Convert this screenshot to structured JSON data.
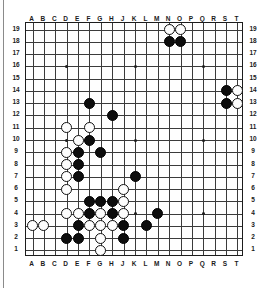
{
  "board": {
    "title": "Go board diagram",
    "size": 19,
    "column_labels": [
      "A",
      "B",
      "C",
      "D",
      "E",
      "F",
      "G",
      "H",
      "J",
      "K",
      "L",
      "M",
      "N",
      "O",
      "P",
      "Q",
      "R",
      "S",
      "T"
    ],
    "row_labels": [
      "19",
      "18",
      "17",
      "16",
      "15",
      "14",
      "13",
      "12",
      "11",
      "10",
      "9",
      "8",
      "7",
      "6",
      "5",
      "4",
      "3",
      "2",
      "1"
    ],
    "colors": {
      "black_stone": "#0d0d0d",
      "white_stone": "#fdfdfd",
      "grid_line": "#3a3a3a",
      "border": "#1c1c1c",
      "background": "#fefefe",
      "label_text": "#1a1a1a"
    },
    "star_points": [
      {
        "col": "D",
        "row": 16
      },
      {
        "col": "K",
        "row": 16
      },
      {
        "col": "Q",
        "row": 16
      },
      {
        "col": "D",
        "row": 10
      },
      {
        "col": "K",
        "row": 10
      },
      {
        "col": "Q",
        "row": 10
      },
      {
        "col": "D",
        "row": 4
      },
      {
        "col": "K",
        "row": 4
      },
      {
        "col": "Q",
        "row": 4
      }
    ],
    "black_stones": [
      {
        "col": "N",
        "row": 18
      },
      {
        "col": "O",
        "row": 18
      },
      {
        "col": "S",
        "row": 14
      },
      {
        "col": "S",
        "row": 13
      },
      {
        "col": "F",
        "row": 13
      },
      {
        "col": "H",
        "row": 12
      },
      {
        "col": "F",
        "row": 10
      },
      {
        "col": "E",
        "row": 9
      },
      {
        "col": "G",
        "row": 9
      },
      {
        "col": "E",
        "row": 8
      },
      {
        "col": "E",
        "row": 7
      },
      {
        "col": "K",
        "row": 7
      },
      {
        "col": "F",
        "row": 5
      },
      {
        "col": "G",
        "row": 5
      },
      {
        "col": "H",
        "row": 5
      },
      {
        "col": "F",
        "row": 4
      },
      {
        "col": "H",
        "row": 4
      },
      {
        "col": "M",
        "row": 4
      },
      {
        "col": "E",
        "row": 3
      },
      {
        "col": "J",
        "row": 3
      },
      {
        "col": "L",
        "row": 3
      },
      {
        "col": "D",
        "row": 2
      },
      {
        "col": "E",
        "row": 2
      },
      {
        "col": "J",
        "row": 2
      }
    ],
    "white_stones": [
      {
        "col": "N",
        "row": 19
      },
      {
        "col": "O",
        "row": 19
      },
      {
        "col": "T",
        "row": 14
      },
      {
        "col": "T",
        "row": 13
      },
      {
        "col": "D",
        "row": 11
      },
      {
        "col": "F",
        "row": 11
      },
      {
        "col": "E",
        "row": 10
      },
      {
        "col": "D",
        "row": 9
      },
      {
        "col": "D",
        "row": 8
      },
      {
        "col": "D",
        "row": 7
      },
      {
        "col": "D",
        "row": 6
      },
      {
        "col": "J",
        "row": 6
      },
      {
        "col": "J",
        "row": 5
      },
      {
        "col": "D",
        "row": 4
      },
      {
        "col": "E",
        "row": 4
      },
      {
        "col": "G",
        "row": 4
      },
      {
        "col": "J",
        "row": 4
      },
      {
        "col": "A",
        "row": 3
      },
      {
        "col": "B",
        "row": 3
      },
      {
        "col": "F",
        "row": 3
      },
      {
        "col": "G",
        "row": 3
      },
      {
        "col": "H",
        "row": 3
      },
      {
        "col": "G",
        "row": 2
      },
      {
        "col": "G",
        "row": 1
      }
    ],
    "caption": ""
  }
}
